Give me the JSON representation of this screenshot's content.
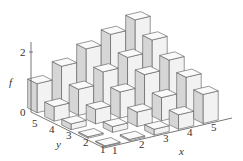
{
  "chart_data": {
    "type": "bar3d",
    "title": "",
    "xlabel": "x",
    "ylabel": "y",
    "zlabel": "f",
    "x": [
      1,
      2,
      3,
      4,
      5
    ],
    "y": [
      1,
      2,
      3,
      4,
      5
    ],
    "z_ticks": [
      0,
      2
    ],
    "zlim": [
      0,
      2.6
    ],
    "values_by_y": {
      "1": [
        0.0,
        0.05,
        0.2,
        0.5,
        1.0
      ],
      "2": [
        0.05,
        0.2,
        0.5,
        0.8,
        1.3
      ],
      "3": [
        0.2,
        0.5,
        0.9,
        1.3,
        1.6
      ],
      "4": [
        0.5,
        0.9,
        1.3,
        1.6,
        2.0
      ],
      "5": [
        1.0,
        1.4,
        1.8,
        2.1,
        2.4
      ]
    },
    "grid": false,
    "legend": null
  },
  "axes": {
    "z_tick_labels": [
      "0",
      "2"
    ],
    "x_tick_labels": [
      "1",
      "2",
      "3",
      "4",
      "5"
    ],
    "y_tick_labels": [
      "1",
      "2",
      "3",
      "4",
      "5"
    ],
    "x_label": "x",
    "y_label": "y",
    "z_label": "f"
  },
  "colors": {
    "bar_front": "#f2f2f2",
    "bar_side": "#d6d6d6",
    "bar_top": "#fafafa",
    "edge": "#555555"
  }
}
